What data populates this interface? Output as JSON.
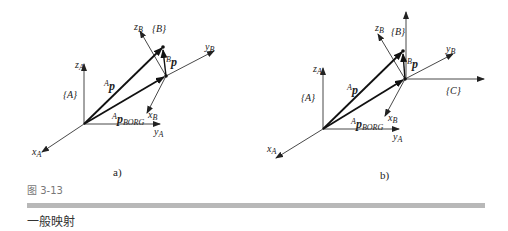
{
  "figure": {
    "number": "图 3-13",
    "title": "一般映射",
    "accent_bar_color": "#b8b8b8"
  },
  "panels": [
    {
      "id": "a",
      "label": "a)",
      "frames": [
        "{A}",
        "{B}"
      ],
      "axes": {
        "xA": "x",
        "yA": "y",
        "zA": "z",
        "xB": "x",
        "yB": "y",
        "zB": "z"
      },
      "subscripts": {
        "A": "A",
        "B": "B"
      },
      "vectors": {
        "AP": "p",
        "BP": "p",
        "APBORG": "p",
        "BORG": "BORG"
      },
      "superscripts": {
        "A": "A",
        "B": "B"
      }
    },
    {
      "id": "b",
      "label": "b)",
      "frames": [
        "{A}",
        "{B}",
        "{C}"
      ],
      "axes": {
        "xA": "x",
        "yA": "y",
        "zA": "z",
        "xB": "x",
        "yB": "y",
        "zB": "z"
      },
      "subscripts": {
        "A": "A",
        "B": "B"
      },
      "vectors": {
        "AP": "p",
        "BP": "p",
        "APBORG": "p",
        "BORG": "BORG"
      },
      "superscripts": {
        "A": "A",
        "B": "B"
      }
    }
  ]
}
